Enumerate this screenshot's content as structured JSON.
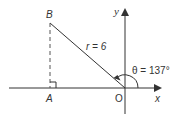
{
  "diagram": {
    "type": "polar-coordinate-triangle",
    "points": {
      "B": {
        "label": "B"
      },
      "A": {
        "label": "A"
      },
      "O": {
        "label": "O"
      }
    },
    "axes": {
      "x_label": "x",
      "y_label": "y"
    },
    "radius_label": "r = 6",
    "angle_label": "θ = 137°",
    "colors": {
      "line": "#333333",
      "background": "#ffffff"
    }
  }
}
